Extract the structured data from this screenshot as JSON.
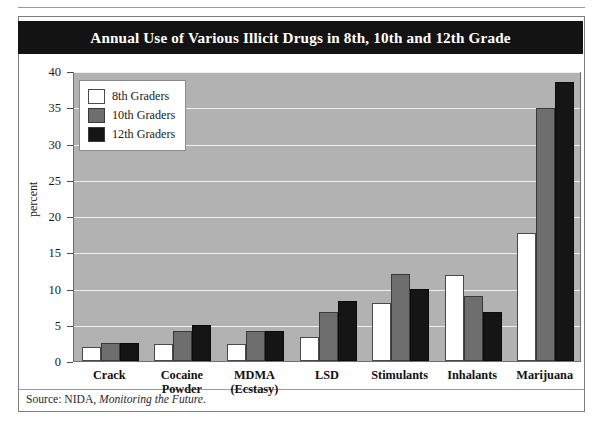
{
  "title": "Annual Use of Various Illicit Drugs in 8th, 10th and 12th Grade",
  "source": {
    "prefix": "Source: NIDA, ",
    "italic": "Monitoring the Future",
    "suffix": "."
  },
  "colors": {
    "title_bar": "#131313",
    "plot_background": "#b2b2b2",
    "gridline": "#efefef",
    "series_8th": "#ffffff",
    "series_10th": "#6e6e6e",
    "series_12th": "#151515"
  },
  "chart_data": {
    "type": "bar",
    "title": "Annual Use of Various Illicit Drugs in 8th, 10th and 12th Grade",
    "xlabel": "",
    "ylabel": "percent",
    "ylim": [
      0,
      40
    ],
    "yticks": [
      0,
      5,
      10,
      15,
      20,
      25,
      30,
      35,
      40
    ],
    "ytick_labels": [
      "0",
      "5",
      "10",
      "15",
      "20",
      "25",
      "30",
      "35",
      "40"
    ],
    "grid": true,
    "legend_position": "upper-left-inside",
    "categories": [
      "Crack",
      "Cocaine Powder",
      "MDMA (Ecstasy)",
      "LSD",
      "Stimulants",
      "Inhalants",
      "Marijuana"
    ],
    "category_lines": [
      [
        "Crack"
      ],
      [
        "Cocaine",
        "Powder"
      ],
      [
        "MDMA",
        "(Ecstasy)"
      ],
      [
        "LSD"
      ],
      [
        "Stimulants"
      ],
      [
        "Inhalants"
      ],
      [
        "Marijuana"
      ]
    ],
    "series": [
      {
        "name": "8th Graders",
        "values": [
          2.0,
          2.3,
          2.3,
          3.3,
          8.0,
          11.8,
          17.7
        ]
      },
      {
        "name": "10th Graders",
        "values": [
          2.5,
          4.2,
          4.2,
          6.8,
          12.0,
          9.0,
          34.9
        ]
      },
      {
        "name": "12th Graders",
        "values": [
          2.5,
          5.0,
          4.2,
          8.3,
          10.0,
          6.8,
          38.5
        ]
      }
    ]
  }
}
